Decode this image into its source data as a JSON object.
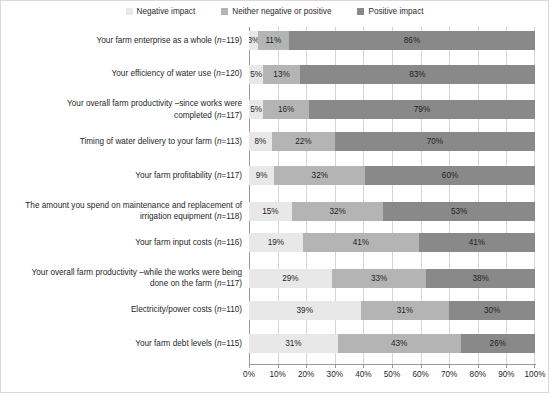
{
  "legend": {
    "items": [
      {
        "label": "Negative impact",
        "color": "#e8e8e8",
        "icon": "legend-swatch-icon"
      },
      {
        "label": "Neither negative or positive",
        "color": "#b4b4b4",
        "icon": "legend-swatch-icon"
      },
      {
        "label": "Positive impact",
        "color": "#898989",
        "icon": "legend-swatch-icon"
      }
    ]
  },
  "chart_data": {
    "type": "bar",
    "orientation": "horizontal",
    "stacked": true,
    "title": "",
    "xlabel": "",
    "ylabel": "",
    "xlim": [
      0,
      100
    ],
    "grid": true,
    "legend_position": "top-center",
    "tick_labels": [
      "0%",
      "10%",
      "20%",
      "30%",
      "40%",
      "50%",
      "60%",
      "70%",
      "80%",
      "90%",
      "100%"
    ],
    "tick_values": [
      0,
      10,
      20,
      30,
      40,
      50,
      60,
      70,
      80,
      90,
      100
    ],
    "series": [
      {
        "name": "Negative impact",
        "color": "#e8e8e8",
        "values": [
          3,
          5,
          5,
          8,
          9,
          15,
          19,
          29,
          39,
          31
        ]
      },
      {
        "name": "Neither negative or positive",
        "color": "#b4b4b4",
        "values": [
          11,
          13,
          16,
          22,
          32,
          32,
          41,
          33,
          31,
          43
        ]
      },
      {
        "name": "Positive impact",
        "color": "#898989",
        "values": [
          86,
          83,
          79,
          70,
          60,
          53,
          41,
          38,
          30,
          26
        ]
      }
    ],
    "categories": [
      "Your farm enterprise as a whole  (n=119)",
      "Your efficiency of water use  (n=120)",
      "Your overall farm productivity –since works were completed  (n=117)",
      "Timing of water delivery to your farm  (n=113)",
      "Your farm profitability  (n=117)",
      "The amount you spend on maintenance and replacement of irrigation equipment  (n=118)",
      "Your farm input costs  (n=116)",
      "Your overall farm productivity –while the works were being done on the farm  (n=117)",
      "Electricity/power costs  (n=110)",
      "Your farm debt levels  (n=115)"
    ],
    "rows": [
      {
        "label_lines": [
          "Your farm enterprise as a whole  (n=119)"
        ],
        "n": 119,
        "segments": [
          {
            "series": "Negative impact",
            "value": 3,
            "data_label": "3%"
          },
          {
            "series": "Neither negative or positive",
            "value": 11,
            "data_label": "11%"
          },
          {
            "series": "Positive impact",
            "value": 86,
            "data_label": "86%"
          }
        ]
      },
      {
        "label_lines": [
          "Your efficiency of water use  (n=120)"
        ],
        "n": 120,
        "segments": [
          {
            "series": "Negative impact",
            "value": 5,
            "data_label": "5%"
          },
          {
            "series": "Neither negative or positive",
            "value": 13,
            "data_label": "13%"
          },
          {
            "series": "Positive impact",
            "value": 83,
            "data_label": "83%"
          }
        ]
      },
      {
        "label_lines": [
          "Your overall farm productivity –since works were",
          "completed  (n=117)"
        ],
        "n": 117,
        "segments": [
          {
            "series": "Negative impact",
            "value": 5,
            "data_label": "5%"
          },
          {
            "series": "Neither negative or positive",
            "value": 16,
            "data_label": "16%"
          },
          {
            "series": "Positive impact",
            "value": 79,
            "data_label": "79%"
          }
        ]
      },
      {
        "label_lines": [
          "Timing of water delivery to your farm  (n=113)"
        ],
        "n": 113,
        "segments": [
          {
            "series": "Negative impact",
            "value": 8,
            "data_label": "8%"
          },
          {
            "series": "Neither negative or positive",
            "value": 22,
            "data_label": "22%"
          },
          {
            "series": "Positive impact",
            "value": 70,
            "data_label": "70%"
          }
        ]
      },
      {
        "label_lines": [
          "Your farm profitability  (n=117)"
        ],
        "n": 117,
        "segments": [
          {
            "series": "Negative impact",
            "value": 9,
            "data_label": "9%"
          },
          {
            "series": "Neither negative or positive",
            "value": 32,
            "data_label": "32%"
          },
          {
            "series": "Positive impact",
            "value": 60,
            "data_label": "60%"
          }
        ]
      },
      {
        "label_lines": [
          "The amount you spend on maintenance and replacement of",
          "irrigation equipment  (n=118)"
        ],
        "n": 118,
        "segments": [
          {
            "series": "Negative impact",
            "value": 15,
            "data_label": "15%"
          },
          {
            "series": "Neither negative or positive",
            "value": 32,
            "data_label": "32%"
          },
          {
            "series": "Positive impact",
            "value": 53,
            "data_label": "53%"
          }
        ]
      },
      {
        "label_lines": [
          "Your farm input costs  (n=116)"
        ],
        "n": 116,
        "segments": [
          {
            "series": "Negative impact",
            "value": 19,
            "data_label": "19%"
          },
          {
            "series": "Neither negative or positive",
            "value": 41,
            "data_label": "41%"
          },
          {
            "series": "Positive impact",
            "value": 41,
            "data_label": "41%"
          }
        ]
      },
      {
        "label_lines": [
          "Your overall farm productivity –while the works were being",
          "done on the farm  (n=117)"
        ],
        "n": 117,
        "segments": [
          {
            "series": "Negative impact",
            "value": 29,
            "data_label": "29%"
          },
          {
            "series": "Neither negative or positive",
            "value": 33,
            "data_label": "33%"
          },
          {
            "series": "Positive impact",
            "value": 38,
            "data_label": "38%"
          }
        ]
      },
      {
        "label_lines": [
          "Electricity/power costs  (n=110)"
        ],
        "n": 110,
        "segments": [
          {
            "series": "Negative impact",
            "value": 39,
            "data_label": "39%"
          },
          {
            "series": "Neither negative or positive",
            "value": 31,
            "data_label": "31%"
          },
          {
            "series": "Positive impact",
            "value": 30,
            "data_label": "30%"
          }
        ]
      },
      {
        "label_lines": [
          "Your farm debt levels  (n=115)"
        ],
        "n": 115,
        "segments": [
          {
            "series": "Negative impact",
            "value": 31,
            "data_label": "31%"
          },
          {
            "series": "Neither negative or positive",
            "value": 43,
            "data_label": "43%"
          },
          {
            "series": "Positive impact",
            "value": 26,
            "data_label": "26%"
          }
        ]
      }
    ]
  }
}
